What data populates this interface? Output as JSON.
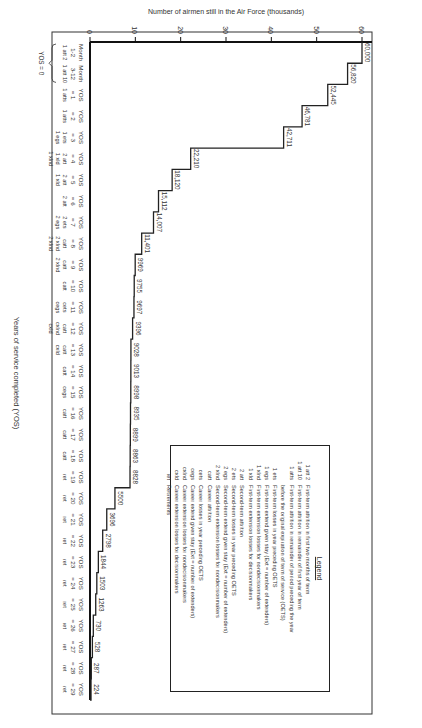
{
  "chart_data": {
    "type": "line",
    "subtype": "step",
    "orientation": "rotated-90-clockwise",
    "title": "",
    "xlabel": "Years of service completed (YOS)",
    "ylabel": "Number of airmen still in the Air Force (thousands)",
    "ylim": [
      0,
      60
    ],
    "yticks": [
      0,
      10,
      20,
      30,
      40,
      50,
      60
    ],
    "grid": false,
    "legend_position": "upper-right (inside plot)",
    "categories": [
      {
        "top": "Month",
        "mid": "1-2",
        "codes": [
          "1 att 2"
        ]
      },
      {
        "top": "Month",
        "mid": "3-12",
        "codes": [
          "1 att 10"
        ]
      },
      {
        "top": "YOS",
        "mid": "= 1",
        "codes": [
          "1 atts"
        ]
      },
      {
        "top": "YOS",
        "mid": "= 2",
        "codes": [
          "1 atts"
        ]
      },
      {
        "top": "YOS",
        "mid": "= 3",
        "codes": [
          "1 ets",
          "1 egs"
        ]
      },
      {
        "top": "YOS",
        "mid": "= 4",
        "codes": [
          "2 att",
          "1 xld",
          "1 xlnd"
        ]
      },
      {
        "top": "YOS",
        "mid": "= 5",
        "codes": [
          "2 att",
          "1 xld"
        ]
      },
      {
        "top": "YOS",
        "mid": "= 6",
        "codes": [
          "2 att"
        ]
      },
      {
        "top": "YOS",
        "mid": "= 7",
        "codes": [
          "2 ets",
          "2 egs"
        ]
      },
      {
        "top": "YOS",
        "mid": "= 8",
        "codes": [
          "catt",
          "2 xlnd",
          "2 xlnd"
        ]
      },
      {
        "top": "YOS",
        "mid": "= 9",
        "codes": [
          "catt",
          "2 xlnd"
        ]
      },
      {
        "top": "YOS",
        "mid": "= 10",
        "codes": [
          "catt"
        ]
      },
      {
        "top": "YOS",
        "mid": "= 11",
        "codes": [
          "cets",
          "cegs"
        ]
      },
      {
        "top": "YOS",
        "mid": "= 12",
        "codes": [
          "catt",
          "cxlnd",
          "cxld"
        ]
      },
      {
        "top": "YOS",
        "mid": "= 13",
        "codes": [
          "catt",
          "cxld"
        ]
      },
      {
        "top": "YOS",
        "mid": "= 14",
        "codes": [
          "catt"
        ]
      },
      {
        "top": "YOS",
        "mid": "= 15",
        "codes": [
          "cegs"
        ]
      },
      {
        "top": "YOS",
        "mid": "= 16",
        "codes": [
          "catt"
        ]
      },
      {
        "top": "YOS",
        "mid": "= 17",
        "codes": [
          "catt"
        ]
      },
      {
        "top": "YOS",
        "mid": "= 18",
        "codes": [
          "catt"
        ]
      },
      {
        "top": "YOS",
        "mid": "= 19",
        "codes": [
          "ret"
        ]
      },
      {
        "top": "YOS",
        "mid": "= 20",
        "codes": [
          "ret"
        ]
      },
      {
        "top": "YOS",
        "mid": "= 21",
        "codes": [
          "ret"
        ]
      },
      {
        "top": "YOS",
        "mid": "= 22",
        "codes": [
          "ret"
        ]
      },
      {
        "top": "YOS",
        "mid": "= 23",
        "codes": [
          "ret"
        ]
      },
      {
        "top": "YOS",
        "mid": "= 24",
        "codes": [
          "ret"
        ]
      },
      {
        "top": "YOS",
        "mid": "= 25",
        "codes": [
          "ret"
        ]
      },
      {
        "top": "YOS",
        "mid": "= 26",
        "codes": [
          "ret"
        ]
      },
      {
        "top": "YOS",
        "mid": "= 27",
        "codes": [
          "ret"
        ]
      },
      {
        "top": "YOS",
        "mid": "= 28",
        "codes": [
          "ret"
        ]
      },
      {
        "top": "YOS",
        "mid": "= 29",
        "codes": [
          "ret"
        ]
      }
    ],
    "series": [
      {
        "name": "Airmen remaining",
        "values": [
          60000,
          56820,
          52445,
          46781,
          42711,
          22210,
          18120,
          15112,
          14007,
          11401,
          9969,
          9755,
          9697,
          9396,
          9028,
          9013,
          8998,
          8935,
          8899,
          8863,
          8828,
          5500,
          3696,
          2798,
          1844,
          1503,
          1263,
          730,
          528,
          287,
          224
        ],
        "labels": [
          "60,000",
          "56,820",
          "52,445",
          "46,781",
          "42,711",
          "22,210",
          "18,120",
          "15,112",
          "14,007",
          "11,401",
          "9969",
          "9755",
          "9697",
          "9396",
          "9028",
          "9013",
          "8998",
          "8935",
          "8899",
          "8863",
          "8828",
          "5500",
          "3696",
          "2798",
          "1844",
          "1503",
          "1263",
          "730",
          "528",
          "287",
          "224"
        ]
      }
    ],
    "annotations": [
      {
        "text": "YOS = 0",
        "applies_to": [
          "Month 1-2",
          "Month 3-12"
        ]
      }
    ]
  },
  "legend": {
    "title": "Legend",
    "entries": [
      {
        "code": "1 att 2",
        "desc": [
          "First-term attrition in first two months of term"
        ]
      },
      {
        "code": "1 att 10",
        "desc": [
          "First-term attrition in remainder of first year of term"
        ]
      },
      {
        "code": "1 atts",
        "desc": [
          "First-term attrition in remainder of period preceding the year",
          "before the original expiration of term of service (OETS)"
        ]
      },
      {
        "code": "1 ets",
        "desc": [
          "First-term losses in year preceding OETS"
        ]
      },
      {
        "code": "1 egs",
        "desc": [
          "First-term extend given stay (Ext = number of extenders)"
        ]
      },
      {
        "code": "1 xlnd",
        "desc": [
          "First-term extension losses for nondecisionmakers"
        ]
      },
      {
        "code": "1 xld",
        "desc": [
          "First-term extension losses for decisionmakers"
        ]
      },
      {
        "code": "2 att",
        "desc": [
          "Second-term attrition"
        ]
      },
      {
        "code": "2 ets",
        "desc": [
          "Second-term losses in year preceding OETS"
        ]
      },
      {
        "code": "2 egs",
        "desc": [
          "Second-term extend given stay (Ext = number of extenders)"
        ]
      },
      {
        "code": "2 xlnd",
        "desc": [
          "Second-term extension losses for nondecisionmakers"
        ]
      },
      {
        "code": "catt",
        "desc": [
          "Career attrition"
        ]
      },
      {
        "code": "cets",
        "desc": [
          "Career losses in year preceding OETS"
        ]
      },
      {
        "code": "cegs",
        "desc": [
          "Career extend given stay (Ext = number of extenders)"
        ]
      },
      {
        "code": "cxlnd",
        "desc": [
          "Career extension losses for nondecisionmakers"
        ]
      },
      {
        "code": "cxld",
        "desc": [
          "Career extension losses for decisionmakers"
        ]
      },
      {
        "code": "ret",
        "desc": [
          "Retirements"
        ]
      }
    ]
  },
  "colors": {
    "line": "#222222",
    "axis": "#111111",
    "text": "#333333",
    "background": "#ffffff"
  }
}
